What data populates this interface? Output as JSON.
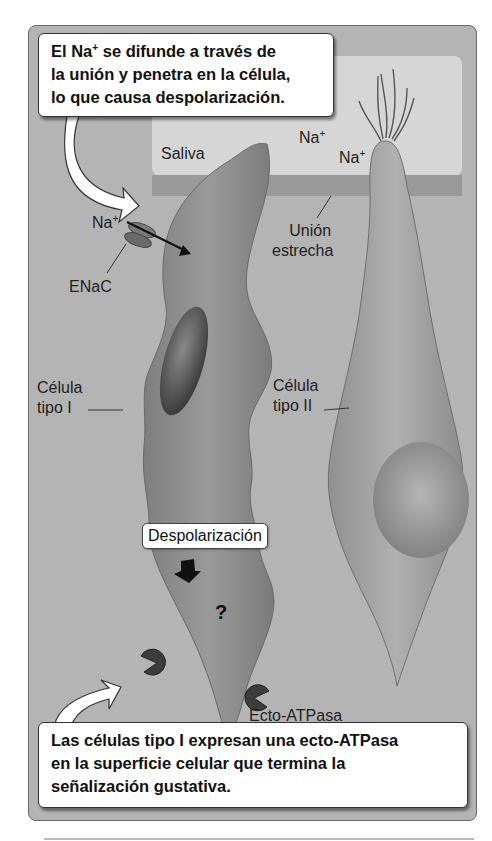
{
  "figure": {
    "top_callout": {
      "line1_pre": "El Na",
      "line1_sup": "+",
      "line1_post": " se difunde a través de",
      "line2": "la unión y penetra en la célula,",
      "line3": "lo que causa despolarización."
    },
    "bottom_callout": {
      "line1": "Las células tipo I expresan una ecto-ATPasa",
      "line2": "en la superficie celular que termina la",
      "line3": "señalización gustativa."
    },
    "labels": {
      "saliva": "Saliva",
      "na_ion_base": "Na",
      "na_ion_sup": "+",
      "tight_junction_line1": "Unión",
      "tight_junction_line2": "estrecha",
      "enac": "ENaC",
      "type1_line1": "Célula",
      "type1_line2": "tipo I",
      "type2_line1": "Célula",
      "type2_line2": "tipo II",
      "depolarization": "Despolarización",
      "unknown_step": "?",
      "ecto_atpase": "Ecto-ATPasa"
    },
    "colors": {
      "background": "#b4b4b4",
      "saliva": "#d6d6d6",
      "junction_band": "#9a9a9a",
      "cell_type1": "#8f8f8f",
      "cell_type2": "#a6a6a6",
      "nucleus": "#5e5e5e"
    }
  }
}
